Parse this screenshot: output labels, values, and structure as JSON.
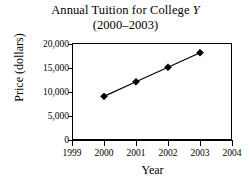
{
  "chart_data": {
    "type": "line",
    "title": "Annual Tuition for College Y",
    "title_plain": "Annual Tuition for College ",
    "title_italic_part": "Y",
    "subtitle": "(2000–2003)",
    "xlabel": "Year",
    "ylabel": "Price (dollars)",
    "x": [
      2000,
      2001,
      2002,
      2003
    ],
    "values": [
      9000,
      12000,
      15000,
      18000
    ],
    "categories": [
      "2000",
      "2001",
      "2002",
      "2003"
    ],
    "xlim": [
      1999,
      2004
    ],
    "ylim": [
      0,
      20000
    ],
    "xticks": [
      1999,
      2000,
      2001,
      2002,
      2003,
      2004
    ],
    "xtick_labels": [
      "1999",
      "2000",
      "2001",
      "2002",
      "2003",
      "2004"
    ],
    "yticks": [
      0,
      5000,
      10000,
      15000,
      20000
    ],
    "ytick_labels": [
      "20,000",
      "15,000",
      "10,000",
      "5,000",
      "0"
    ],
    "grid": false,
    "legend": "none",
    "marker": "diamond",
    "line_color": "#000000",
    "marker_color": "#000000",
    "background_color": "#ffffff",
    "frame_color": "#000000",
    "points": [
      {
        "x": "2000",
        "y": 9000
      },
      {
        "x": "2001",
        "y": 12000
      },
      {
        "x": "2002",
        "y": 15000
      },
      {
        "x": "2003",
        "y": 18000
      }
    ]
  }
}
